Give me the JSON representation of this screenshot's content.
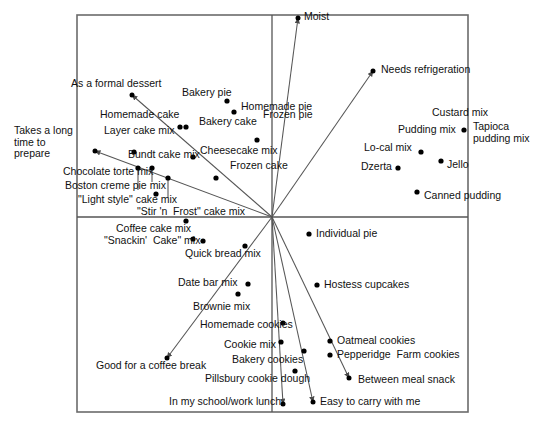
{
  "figure": {
    "kind": "perceptual-map-biplot",
    "frame": {
      "x0": 77,
      "y0": 15,
      "x1": 468,
      "y1": 412
    },
    "origin": {
      "x": 272,
      "y": 217
    },
    "axis_horizontal_label": "",
    "axis_vertical_label": ""
  },
  "chart_data": {
    "type": "scatter",
    "title": "",
    "subtitle": "",
    "xlabel": "",
    "ylabel": "",
    "grid": false,
    "legend": "none",
    "xlim": [
      77,
      468
    ],
    "ylim": [
      15,
      412
    ],
    "axes": {
      "horizontal_axis_y": 217,
      "vertical_axis_x": 272,
      "frame_left": 77,
      "frame_right": 468,
      "frame_top": 15,
      "frame_bottom": 412
    },
    "products": [
      {
        "name": "Bakery pie",
        "x": 227,
        "y": 101,
        "label_x": 182,
        "label_y": 93,
        "anchor": "start"
      },
      {
        "name": "Homemade pie",
        "x": 234,
        "y": 112,
        "label_x": 241,
        "label_y": 107,
        "anchor": "start"
      },
      {
        "name": "Bakery cake",
        "x": 186,
        "y": 127,
        "label_x": 199,
        "label_y": 122,
        "anchor": "start"
      },
      {
        "name": "Homemade cake",
        "x": 180,
        "y": 127,
        "label_x": 100,
        "label_y": 115,
        "anchor": "start"
      },
      {
        "name": "Frozen pie",
        "x": 257,
        "y": 140,
        "label_x": 263,
        "label_y": 115,
        "anchor": "start"
      },
      {
        "name": "Layer cake mix",
        "x": 134,
        "y": 152,
        "label_x": 104,
        "label_y": 131,
        "anchor": "start"
      },
      {
        "name": "Bundt cake mix",
        "x": 138,
        "y": 168,
        "label_x": 128,
        "label_y": 155,
        "anchor": "start"
      },
      {
        "name": "Cheesecake mix",
        "x": 193,
        "y": 157,
        "label_x": 200,
        "label_y": 151,
        "anchor": "start"
      },
      {
        "name": "Frozen cake",
        "x": 216,
        "y": 178,
        "label_x": 230,
        "label_y": 166,
        "anchor": "start"
      },
      {
        "name": "Chocolate torte mix",
        "x": 152,
        "y": 168,
        "label_x": 63,
        "label_y": 172,
        "anchor": "start"
      },
      {
        "name": "Boston creme pie mix",
        "x": 168,
        "y": 178,
        "label_x": 65,
        "label_y": 186,
        "anchor": "start"
      },
      {
        "name": "\"Light style\" cake mix",
        "x": 156,
        "y": 194,
        "label_x": 78,
        "label_y": 200,
        "anchor": "start"
      },
      {
        "name": "\"Stir 'n  Frost\" cake mix",
        "x": 186,
        "y": 221,
        "label_x": 137,
        "label_y": 212,
        "anchor": "start"
      },
      {
        "name": "Coffee cake mix",
        "x": 193,
        "y": 239,
        "label_x": 116,
        "label_y": 229,
        "anchor": "start"
      },
      {
        "name": "\"Snackin'  Cake\" mix",
        "x": 203,
        "y": 241,
        "label_x": 104,
        "label_y": 241,
        "anchor": "start"
      },
      {
        "name": "Quick bread mix",
        "x": 245,
        "y": 246,
        "label_x": 185,
        "label_y": 254,
        "anchor": "start"
      },
      {
        "name": "Date bar mix",
        "x": 248,
        "y": 284,
        "label_x": 178,
        "label_y": 283,
        "anchor": "start"
      },
      {
        "name": "Brownie mix",
        "x": 238,
        "y": 294,
        "label_x": 193,
        "label_y": 307,
        "anchor": "start"
      },
      {
        "name": "Homemade cookies",
        "x": 283,
        "y": 323,
        "label_x": 200,
        "label_y": 325,
        "anchor": "start"
      },
      {
        "name": "Cookie mix",
        "x": 281,
        "y": 342,
        "label_x": 224,
        "label_y": 345,
        "anchor": "start"
      },
      {
        "name": "Bakery cookies",
        "x": 304,
        "y": 351,
        "label_x": 232,
        "label_y": 360,
        "anchor": "start"
      },
      {
        "name": "Pillsbury cookie dough",
        "x": 295,
        "y": 371,
        "label_x": 205,
        "label_y": 379,
        "anchor": "start"
      },
      {
        "name": "Individual pie",
        "x": 309,
        "y": 234,
        "label_x": 316,
        "label_y": 234,
        "anchor": "start"
      },
      {
        "name": "Hostess cupcakes",
        "x": 317,
        "y": 285,
        "label_x": 324,
        "label_y": 285,
        "anchor": "start"
      },
      {
        "name": "Oatmeal cookies",
        "x": 330,
        "y": 341,
        "label_x": 337,
        "label_y": 341,
        "anchor": "start"
      },
      {
        "name": "Pepperidge  Farm cookies",
        "x": 330,
        "y": 355,
        "label_x": 337,
        "label_y": 355,
        "anchor": "start"
      },
      {
        "name": "Custard mix",
        "x": 464,
        "y": 130,
        "label_x": 432,
        "label_y": 113,
        "anchor": "start"
      },
      {
        "name": "Pudding mix",
        "x": 464,
        "y": 130,
        "label_x": 398,
        "label_y": 130,
        "anchor": "start"
      },
      {
        "name": "Tapioca pudding mix",
        "x": 464,
        "y": 130,
        "label_x": 473,
        "label_y": 127,
        "anchor": "start"
      },
      {
        "name": "Lo-cal mix",
        "x": 421,
        "y": 152,
        "label_x": 364,
        "label_y": 148,
        "anchor": "start"
      },
      {
        "name": "Jello",
        "x": 441,
        "y": 161,
        "label_x": 447,
        "label_y": 165,
        "anchor": "start"
      },
      {
        "name": "Dzerta",
        "x": 398,
        "y": 168,
        "label_x": 361,
        "label_y": 167,
        "anchor": "start"
      },
      {
        "name": "Canned pudding",
        "x": 417,
        "y": 192,
        "label_x": 424,
        "label_y": 196,
        "anchor": "start"
      }
    ],
    "attribute_vectors": [
      {
        "name": "Moist",
        "tip_x": 298,
        "tip_y": 18,
        "label_x": 304,
        "label_y": 17,
        "anchor": "start"
      },
      {
        "name": "Needs refrigeration",
        "tip_x": 373,
        "tip_y": 71,
        "label_x": 381,
        "label_y": 70,
        "anchor": "start"
      },
      {
        "name": "As a formal dessert",
        "tip_x": 132,
        "tip_y": 95,
        "label_x": 71,
        "label_y": 84,
        "anchor": "start"
      },
      {
        "name": "Takes a long time to prepare",
        "tip_x": 95,
        "tip_y": 151,
        "label_x": 14,
        "label_y": 131,
        "anchor": "start"
      },
      {
        "name": "Good for a coffee break",
        "tip_x": 167,
        "tip_y": 358,
        "label_x": 96,
        "label_y": 366,
        "anchor": "start"
      },
      {
        "name": "Between meal snack",
        "tip_x": 349,
        "tip_y": 378,
        "label_x": 358,
        "label_y": 380,
        "anchor": "start"
      },
      {
        "name": "Easy to carry with me",
        "tip_x": 313,
        "tip_y": 402,
        "label_x": 320,
        "label_y": 402,
        "anchor": "start"
      },
      {
        "name": "In my school/work lunch",
        "tip_x": 283,
        "tip_y": 404,
        "label_x": 169,
        "label_y": 402,
        "anchor": "start"
      }
    ],
    "point_leader_lines": [
      {
        "from_x": 138,
        "from_y": 168,
        "to_x": 138,
        "to_y": 190
      },
      {
        "from_x": 152,
        "from_y": 168,
        "to_x": 152,
        "to_y": 182
      },
      {
        "from_x": 168,
        "from_y": 178,
        "to_x": 168,
        "to_y": 198
      }
    ]
  },
  "colors": {
    "frame": "#6b6b6b",
    "axis": "#555555",
    "vector": "#555555",
    "point": "#000000",
    "text": "#111111",
    "background": "#ffffff"
  }
}
